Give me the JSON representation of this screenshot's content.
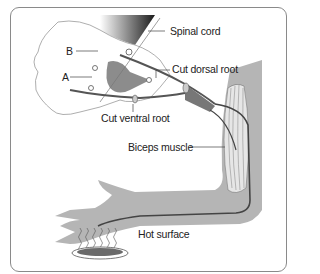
{
  "figure": {
    "labels": {
      "spinal_cord": "Spinal cord",
      "cut_dorsal_root": "Cut dorsal root",
      "b": "B",
      "a": "A",
      "cut_ventral_root": "Cut ventral root",
      "biceps_muscle": "Biceps muscle",
      "hot_surface": "Hot surface"
    },
    "colors": {
      "border": "#8a8a8a",
      "limb_fill": "#b5b5b5",
      "nerve": "#555555",
      "spinal_outline": "#999999",
      "heat_plate": "#6a6a6a"
    }
  }
}
